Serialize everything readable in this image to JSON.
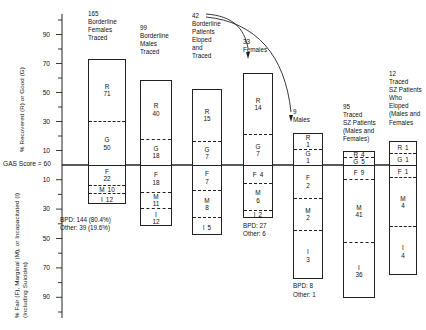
{
  "axes": {
    "upper_title": "% Recovered (R) or Good (G)",
    "lower_title": "% Fair (F), Marginal (M), or Incapacitated (I)\n(Including Suicides)",
    "gas_line_label": "GAS Score = 60",
    "upper_ticks": [
      "90",
      "70",
      "50",
      "30",
      "10"
    ],
    "lower_ticks": [
      "10",
      "30",
      "50",
      "70",
      "90"
    ]
  },
  "chart_data": {
    "type": "bar",
    "title": "",
    "xlabel": "",
    "ylabel": "% Recovered (R) or Good (G) / % Fair (F), Marginal (M), or Incapacitated (I) (Including Suicides)",
    "ylim": [
      -100,
      100
    ],
    "baseline": "GAS Score = 60",
    "grid": false,
    "legend": "none",
    "segment_keys": [
      "R",
      "G",
      "F",
      "M",
      "I"
    ],
    "categories": [
      "165 Borderline Females Traced",
      "99 Borderline Males Traced",
      "42 Borderline Patients Eloped and Traced",
      "33 Females",
      "9 Males",
      "95 Traced SZ Patients (Males and Females)",
      "12 Traced SZ Patients Who Eloped (Males and Females)"
    ],
    "series": [
      {
        "name": "R",
        "values": [
          71,
          40,
          15,
          14,
          1,
          4,
          1
        ]
      },
      {
        "name": "G",
        "values": [
          50,
          18,
          7,
          7,
          1,
          5,
          1
        ]
      },
      {
        "name": "F",
        "values": [
          22,
          18,
          7,
          4,
          2,
          9,
          1
        ]
      },
      {
        "name": "M",
        "values": [
          10,
          11,
          8,
          6,
          2,
          41,
          4
        ]
      },
      {
        "name": "I",
        "values": [
          12,
          12,
          5,
          2,
          3,
          36,
          4
        ]
      }
    ],
    "annotations": [
      "BPD: 144 (80.4%)",
      "Other: 39 (19.6%)",
      "BPD: 27",
      "Other: 6",
      "BPD: 8",
      "Other: 1"
    ]
  },
  "columns": [
    {
      "id": "borderline-females-traced",
      "header": "165\nBorderline\nFemales\nTraced",
      "total": "165",
      "segments": [
        {
          "key": "R",
          "label": "R",
          "value": "71",
          "pct": 43.0,
          "inline": false
        },
        {
          "key": "G",
          "label": "G",
          "value": "50",
          "pct": 30.3,
          "inline": false
        },
        {
          "key": "F",
          "label": "F",
          "value": "22",
          "pct": 13.3,
          "inline": false
        },
        {
          "key": "M",
          "label": "M",
          "value": "10",
          "pct": 6.1,
          "inline": true
        },
        {
          "key": "I",
          "label": "I",
          "value": "12",
          "pct": 7.3,
          "inline": true
        }
      ],
      "footnote": "BPD: 144 (80.4%)\nOther: 39 (19.6%)"
    },
    {
      "id": "borderline-males-traced",
      "header": "99\nBorderline\nMales\nTraced",
      "total": "99",
      "segments": [
        {
          "key": "R",
          "label": "R",
          "value": "40",
          "pct": 40.4,
          "inline": false
        },
        {
          "key": "G",
          "label": "G",
          "value": "18",
          "pct": 18.2,
          "inline": false
        },
        {
          "key": "F",
          "label": "F",
          "value": "18",
          "pct": 18.2,
          "inline": false
        },
        {
          "key": "M",
          "label": "M",
          "value": "11",
          "pct": 11.1,
          "inline": false
        },
        {
          "key": "I",
          "label": "I",
          "value": "12",
          "pct": 12.1,
          "inline": false
        }
      ],
      "footnote": ""
    },
    {
      "id": "borderline-eloped-traced",
      "header": "42\nBorderline\nPatients\nEloped\nand\nTraced",
      "total": "42",
      "segments": [
        {
          "key": "R",
          "label": "R",
          "value": "15",
          "pct": 35.7,
          "inline": false
        },
        {
          "key": "G",
          "label": "G",
          "value": "7",
          "pct": 16.7,
          "inline": false
        },
        {
          "key": "F",
          "label": "F",
          "value": "7",
          "pct": 16.7,
          "inline": false
        },
        {
          "key": "M",
          "label": "M",
          "value": "8",
          "pct": 19.0,
          "inline": false
        },
        {
          "key": "I",
          "label": "I",
          "value": "5",
          "pct": 11.9,
          "inline": true
        }
      ],
      "footnote": ""
    },
    {
      "id": "eloped-females",
      "header": "33\nFemales",
      "total": "33",
      "segments": [
        {
          "key": "R",
          "label": "R",
          "value": "14",
          "pct": 42.4,
          "inline": false
        },
        {
          "key": "G",
          "label": "G",
          "value": "7",
          "pct": 21.2,
          "inline": false
        },
        {
          "key": "F",
          "label": "F",
          "value": "4",
          "pct": 12.1,
          "inline": true
        },
        {
          "key": "M",
          "label": "M",
          "value": "6",
          "pct": 18.2,
          "inline": false
        },
        {
          "key": "I",
          "label": "I",
          "value": "2",
          "pct": 6.1,
          "inline": true
        }
      ],
      "footnote": "BPD: 27\nOther: 6"
    },
    {
      "id": "eloped-males",
      "header": "9\nMales",
      "total": "9",
      "segments": [
        {
          "key": "R",
          "label": "R",
          "value": "1",
          "pct": 11.1,
          "inline": false
        },
        {
          "key": "G",
          "label": "G",
          "value": "1",
          "pct": 11.1,
          "inline": false
        },
        {
          "key": "F",
          "label": "F",
          "value": "2",
          "pct": 22.2,
          "inline": false
        },
        {
          "key": "M",
          "label": "M",
          "value": "2",
          "pct": 22.2,
          "inline": false
        },
        {
          "key": "I",
          "label": "I",
          "value": "3",
          "pct": 33.3,
          "inline": false
        }
      ],
      "footnote": "BPD: 8\nOther: 1"
    },
    {
      "id": "traced-sz-patients",
      "header": "95\nTraced\nSZ Patients\n(Males and\nFemales)",
      "total": "95",
      "segments": [
        {
          "key": "R",
          "label": "R",
          "value": "4",
          "pct": 4.2,
          "inline": true
        },
        {
          "key": "G",
          "label": "G",
          "value": "5",
          "pct": 5.3,
          "inline": true
        },
        {
          "key": "F",
          "label": "F",
          "value": "9",
          "pct": 9.5,
          "inline": true
        },
        {
          "key": "M",
          "label": "M",
          "value": "41",
          "pct": 43.2,
          "inline": false
        },
        {
          "key": "I",
          "label": "I",
          "value": "36",
          "pct": 37.9,
          "inline": false
        }
      ],
      "footnote": ""
    },
    {
      "id": "traced-sz-eloped",
      "header": "12\nTraced\nSZ Patients\nWho\nEloped\n(Males and\nFemales",
      "total": "12",
      "segments": [
        {
          "key": "R",
          "label": "R",
          "value": "1",
          "pct": 8.3,
          "inline": true
        },
        {
          "key": "G",
          "label": "G",
          "value": "1",
          "pct": 8.3,
          "inline": true
        },
        {
          "key": "F",
          "label": "F",
          "value": "1",
          "pct": 8.3,
          "inline": true
        },
        {
          "key": "M",
          "label": "M",
          "value": "4",
          "pct": 33.3,
          "inline": false
        },
        {
          "key": "I",
          "label": "I",
          "value": "4",
          "pct": 33.3,
          "inline": false
        }
      ],
      "footnote": ""
    }
  ],
  "arrows": {
    "from_label": "42",
    "to_labels": [
      "33 Females",
      "9 Males"
    ]
  },
  "colors": {
    "ink": "#222222",
    "background": "#ffffff"
  }
}
